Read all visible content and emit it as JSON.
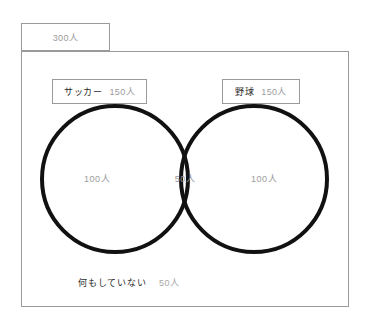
{
  "figure": {
    "type": "venn-diagram",
    "universe": {
      "label": "",
      "count": "300人"
    },
    "sets": [
      {
        "name": "サッカー",
        "count": "150人",
        "only_count": "100人"
      },
      {
        "name": "野球",
        "count": "150人",
        "only_count": "100人"
      }
    ],
    "intersection": {
      "count": "50人"
    },
    "neither": {
      "label": "何もしていない",
      "count": "50人"
    },
    "colors": {
      "circle_stroke": "#111111",
      "frame_stroke": "#9a9a9a",
      "label_text": "#2b2b2b",
      "count_text": "#9b9b9b",
      "background": "#ffffff"
    }
  }
}
